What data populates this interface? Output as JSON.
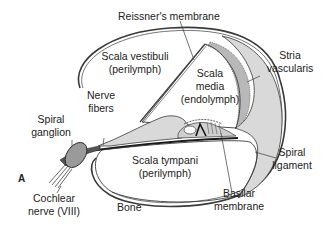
{
  "figure": {
    "panel_letter": "A",
    "labels": {
      "reissners_membrane": "Reissner's membrane",
      "scala_vestibuli": [
        "Scala vestibuli",
        "(perilymph)"
      ],
      "scala_media": [
        "Scala",
        "media",
        "(endolymph)"
      ],
      "stria_vascularis": [
        "Stria",
        "vascularis"
      ],
      "nerve_fibers": [
        "Nerve",
        "fibers"
      ],
      "spiral_ganglion": [
        "Spiral",
        "ganglion"
      ],
      "scala_tympani": [
        "Scala tympani",
        "(perilymph)"
      ],
      "spiral_ligament": [
        "Spiral",
        "ligament"
      ],
      "cochlear_nerve": [
        "Cochlear",
        "nerve (VIII)"
      ],
      "bone": "Bone",
      "basilar_membrane": [
        "Basilar",
        "membrane"
      ]
    },
    "colors": {
      "stroke": "#3a3a3a",
      "tissue_fill": "#d9d9d9",
      "stria_fill": "#b8b8b8",
      "background": "#ffffff"
    }
  }
}
